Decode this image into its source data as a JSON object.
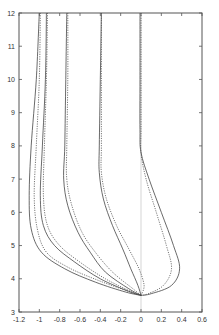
{
  "chart_data": {
    "type": "line",
    "title": "",
    "xlabel": "",
    "ylabel": "",
    "xlim": [
      -1.2,
      0.6
    ],
    "ylim": [
      3,
      12
    ],
    "x_ticks": [
      "-1.2",
      "-1",
      "-0.8",
      "-0.6",
      "-0.4",
      "-0.2",
      "0",
      "0.2",
      "0.4",
      "0.6"
    ],
    "y_ticks": [
      "3",
      "4",
      "5",
      "6",
      "7",
      "8",
      "9",
      "10",
      "11",
      "12"
    ],
    "grid": false,
    "legend": null,
    "reference_line": {
      "x": 0,
      "style": "thin vertical"
    },
    "series": [
      {
        "name": "curve-1-solid",
        "style": "solid",
        "points": [
          [
            -1.0,
            12
          ],
          [
            -1.03,
            10
          ],
          [
            -1.08,
            8
          ],
          [
            -1.1,
            6.5
          ],
          [
            -1.08,
            5.5
          ],
          [
            -0.98,
            4.8
          ],
          [
            -0.75,
            4.3
          ],
          [
            -0.45,
            3.9
          ],
          [
            -0.15,
            3.6
          ],
          [
            0,
            3.5
          ]
        ]
      },
      {
        "name": "curve-1-dotted",
        "style": "dotted",
        "points": [
          [
            -0.99,
            12
          ],
          [
            -1.0,
            10
          ],
          [
            -1.03,
            8
          ],
          [
            -1.05,
            6.5
          ],
          [
            -1.02,
            5.5
          ],
          [
            -0.93,
            4.8
          ],
          [
            -0.72,
            4.35
          ],
          [
            -0.42,
            3.95
          ],
          [
            -0.12,
            3.62
          ],
          [
            0,
            3.5
          ]
        ]
      },
      {
        "name": "curve-2-solid",
        "style": "solid",
        "points": [
          [
            -0.93,
            12
          ],
          [
            -0.94,
            10
          ],
          [
            -0.97,
            8
          ],
          [
            -0.99,
            6.5
          ],
          [
            -0.96,
            5.6
          ],
          [
            -0.85,
            5.0
          ],
          [
            -0.65,
            4.5
          ],
          [
            -0.4,
            4.0
          ],
          [
            -0.12,
            3.62
          ],
          [
            0,
            3.5
          ]
        ]
      },
      {
        "name": "curve-2-dotted",
        "style": "dotted",
        "points": [
          [
            -0.92,
            12
          ],
          [
            -0.93,
            10
          ],
          [
            -0.95,
            8
          ],
          [
            -0.96,
            6.5
          ],
          [
            -0.92,
            5.6
          ],
          [
            -0.8,
            5.0
          ],
          [
            -0.6,
            4.5
          ],
          [
            -0.35,
            4.0
          ],
          [
            -0.1,
            3.62
          ],
          [
            0,
            3.5
          ]
        ]
      },
      {
        "name": "curve-3-solid",
        "style": "solid",
        "points": [
          [
            -0.73,
            12
          ],
          [
            -0.74,
            10
          ],
          [
            -0.75,
            8
          ],
          [
            -0.76,
            7.0
          ],
          [
            -0.72,
            6.2
          ],
          [
            -0.62,
            5.4
          ],
          [
            -0.5,
            4.8
          ],
          [
            -0.35,
            4.2
          ],
          [
            -0.12,
            3.7
          ],
          [
            0,
            3.5
          ]
        ]
      },
      {
        "name": "curve-3-dotted",
        "style": "dotted",
        "points": [
          [
            -0.72,
            12
          ],
          [
            -0.72,
            10
          ],
          [
            -0.73,
            8
          ],
          [
            -0.73,
            7.0
          ],
          [
            -0.68,
            6.2
          ],
          [
            -0.58,
            5.4
          ],
          [
            -0.45,
            4.8
          ],
          [
            -0.28,
            4.2
          ],
          [
            -0.08,
            3.7
          ],
          [
            0,
            3.5
          ]
        ]
      },
      {
        "name": "curve-4-solid",
        "style": "solid",
        "points": [
          [
            -0.39,
            12
          ],
          [
            -0.4,
            10
          ],
          [
            -0.41,
            8
          ],
          [
            -0.41,
            7.2
          ],
          [
            -0.37,
            6.4
          ],
          [
            -0.28,
            5.6
          ],
          [
            -0.18,
            4.9
          ],
          [
            -0.1,
            4.3
          ],
          [
            -0.03,
            3.8
          ],
          [
            0,
            3.5
          ]
        ]
      },
      {
        "name": "curve-4-dotted",
        "style": "dotted",
        "points": [
          [
            -0.39,
            12
          ],
          [
            -0.39,
            10
          ],
          [
            -0.39,
            8
          ],
          [
            -0.39,
            7.2
          ],
          [
            -0.34,
            6.4
          ],
          [
            -0.24,
            5.6
          ],
          [
            -0.12,
            4.9
          ],
          [
            -0.02,
            4.3
          ],
          [
            0.03,
            3.8
          ],
          [
            0,
            3.5
          ]
        ]
      },
      {
        "name": "curve-5-solid",
        "style": "solid",
        "points": [
          [
            -0.01,
            12
          ],
          [
            -0.01,
            10
          ],
          [
            -0.01,
            8.5
          ],
          [
            0.0,
            7.8
          ],
          [
            0.08,
            7.0
          ],
          [
            0.2,
            6.0
          ],
          [
            0.32,
            5.0
          ],
          [
            0.38,
            4.3
          ],
          [
            0.3,
            3.8
          ],
          [
            0.1,
            3.55
          ],
          [
            0,
            3.5
          ]
        ]
      },
      {
        "name": "curve-5-dotted",
        "style": "dotted",
        "points": [
          [
            0.0,
            12
          ],
          [
            0.0,
            10
          ],
          [
            0.0,
            8.5
          ],
          [
            0.0,
            7.8
          ],
          [
            0.05,
            7.0
          ],
          [
            0.15,
            6.0
          ],
          [
            0.25,
            5.0
          ],
          [
            0.3,
            4.3
          ],
          [
            0.22,
            3.8
          ],
          [
            0.07,
            3.55
          ],
          [
            0,
            3.5
          ]
        ]
      }
    ]
  }
}
